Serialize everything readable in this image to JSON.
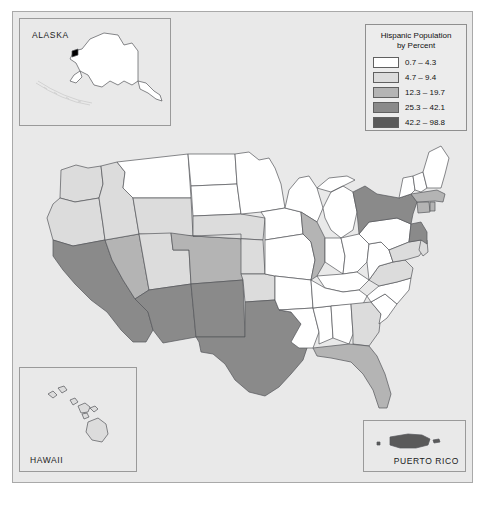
{
  "figure": {
    "background_color": "#e9e9e9",
    "border_color": "#a9a9a9"
  },
  "legend": {
    "title_line1": "Hispanic Population",
    "title_line2": "by Percent",
    "classes": [
      {
        "label": "0.7 – 4.3",
        "color": "#ffffff",
        "min": 0.7,
        "max": 4.3
      },
      {
        "label": "4.7 – 9.4",
        "color": "#dcdcdc",
        "min": 4.7,
        "max": 9.4
      },
      {
        "label": "12.3 – 19.7",
        "color": "#b4b4b4",
        "min": 12.3,
        "max": 19.7
      },
      {
        "label": "25.3 – 42.1",
        "color": "#8a8a8a",
        "min": 25.3,
        "max": 42.1
      },
      {
        "label": "42.2 – 98.8",
        "color": "#5a5a5a",
        "min": 42.2,
        "max": 98.8
      }
    ]
  },
  "insets": {
    "alaska": {
      "label": "ALASKA",
      "class_index": 0
    },
    "hawaii": {
      "label": "HAWAII",
      "class_index": 1
    },
    "puerto_rico": {
      "label": "PUERTO RICO",
      "class_index": 4
    }
  },
  "chart_data": {
    "type": "choropleth-map",
    "title": "Hispanic Population by Percent",
    "unit": "percent",
    "class_breaks": [
      "0.7 – 4.3",
      "4.7 – 9.4",
      "12.3 – 19.7",
      "25.3 – 42.1",
      "42.2 – 98.8"
    ],
    "class_colors": [
      "#ffffff",
      "#dcdcdc",
      "#b4b4b4",
      "#8a8a8a",
      "#5a5a5a"
    ],
    "regions": [
      {
        "code": "AK",
        "name": "Alaska",
        "class": 0
      },
      {
        "code": "HI",
        "name": "Hawaii",
        "class": 1
      },
      {
        "code": "PR",
        "name": "Puerto Rico",
        "class": 4
      },
      {
        "code": "WA",
        "name": "Washington",
        "class": 1
      },
      {
        "code": "OR",
        "name": "Oregon",
        "class": 1
      },
      {
        "code": "ID",
        "name": "Idaho",
        "class": 1
      },
      {
        "code": "MT",
        "name": "Montana",
        "class": 0
      },
      {
        "code": "WY",
        "name": "Wyoming",
        "class": 1
      },
      {
        "code": "CA",
        "name": "California",
        "class": 3
      },
      {
        "code": "NV",
        "name": "Nevada",
        "class": 2
      },
      {
        "code": "UT",
        "name": "Utah",
        "class": 1
      },
      {
        "code": "AZ",
        "name": "Arizona",
        "class": 3
      },
      {
        "code": "CO",
        "name": "Colorado",
        "class": 2
      },
      {
        "code": "NM",
        "name": "New Mexico",
        "class": 3
      },
      {
        "code": "ND",
        "name": "North Dakota",
        "class": 0
      },
      {
        "code": "SD",
        "name": "South Dakota",
        "class": 0
      },
      {
        "code": "NE",
        "name": "Nebraska",
        "class": 1
      },
      {
        "code": "KS",
        "name": "Kansas",
        "class": 1
      },
      {
        "code": "OK",
        "name": "Oklahoma",
        "class": 1
      },
      {
        "code": "TX",
        "name": "Texas",
        "class": 3
      },
      {
        "code": "MN",
        "name": "Minnesota",
        "class": 0
      },
      {
        "code": "IA",
        "name": "Iowa",
        "class": 0
      },
      {
        "code": "MO",
        "name": "Missouri",
        "class": 0
      },
      {
        "code": "AR",
        "name": "Arkansas",
        "class": 0
      },
      {
        "code": "LA",
        "name": "Louisiana",
        "class": 0
      },
      {
        "code": "WI",
        "name": "Wisconsin",
        "class": 0
      },
      {
        "code": "IL",
        "name": "Illinois",
        "class": 2
      },
      {
        "code": "MS",
        "name": "Mississippi",
        "class": 0
      },
      {
        "code": "MI",
        "name": "Michigan",
        "class": 0
      },
      {
        "code": "IN",
        "name": "Indiana",
        "class": 0
      },
      {
        "code": "OH",
        "name": "Ohio",
        "class": 0
      },
      {
        "code": "KY",
        "name": "Kentucky",
        "class": 0
      },
      {
        "code": "TN",
        "name": "Tennessee",
        "class": 0
      },
      {
        "code": "AL",
        "name": "Alabama",
        "class": 0
      },
      {
        "code": "GA",
        "name": "Georgia",
        "class": 1
      },
      {
        "code": "FL",
        "name": "Florida",
        "class": 2
      },
      {
        "code": "SC",
        "name": "South Carolina",
        "class": 0
      },
      {
        "code": "NC",
        "name": "North Carolina",
        "class": 0
      },
      {
        "code": "VA",
        "name": "Virginia",
        "class": 1
      },
      {
        "code": "WV",
        "name": "West Virginia",
        "class": 0
      },
      {
        "code": "PA",
        "name": "Pennsylvania",
        "class": 0
      },
      {
        "code": "NY",
        "name": "New York",
        "class": 3
      },
      {
        "code": "MD",
        "name": "Maryland",
        "class": 1
      },
      {
        "code": "DE",
        "name": "Delaware",
        "class": 1
      },
      {
        "code": "NJ",
        "name": "New Jersey",
        "class": 3
      },
      {
        "code": "CT",
        "name": "Connecticut",
        "class": 2
      },
      {
        "code": "RI",
        "name": "Rhode Island",
        "class": 2
      },
      {
        "code": "MA",
        "name": "Massachusetts",
        "class": 2
      },
      {
        "code": "VT",
        "name": "Vermont",
        "class": 0
      },
      {
        "code": "NH",
        "name": "New Hampshire",
        "class": 0
      },
      {
        "code": "ME",
        "name": "Maine",
        "class": 0
      }
    ]
  }
}
